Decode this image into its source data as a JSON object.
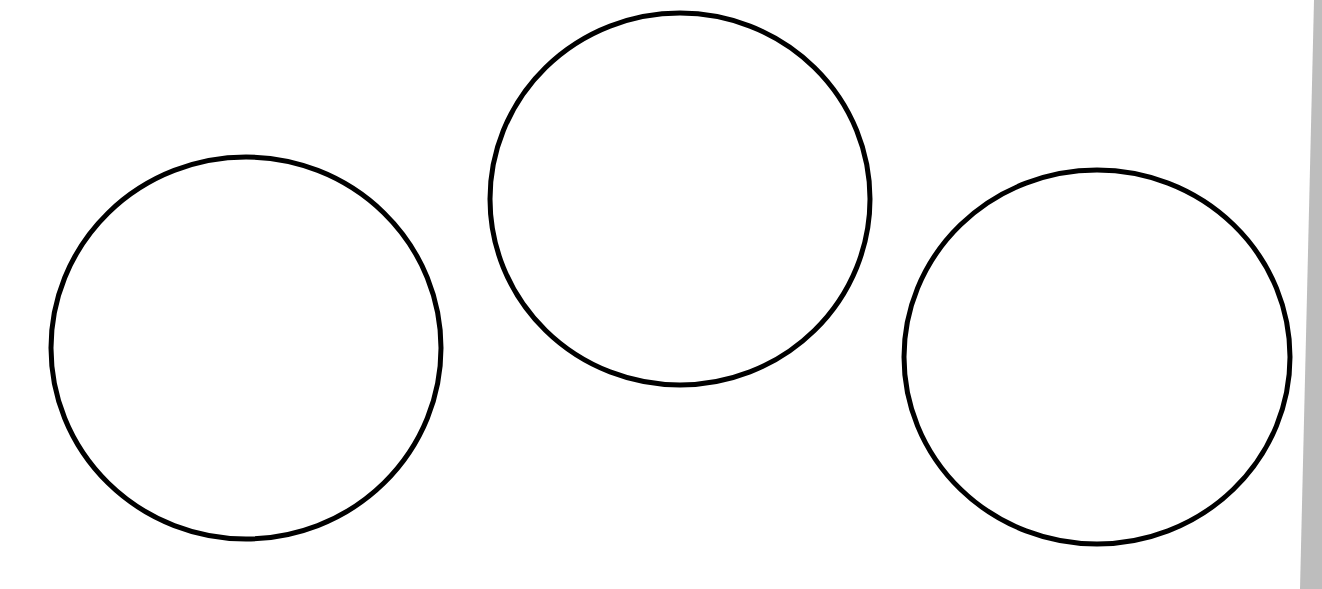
{
  "canvas": {
    "width": 1322,
    "height": 589,
    "background": "#ffffff",
    "stroke_color": "#000000"
  },
  "shapes": [
    {
      "kind": "circle-outline",
      "cx": 246,
      "cy": 348,
      "rx": 195,
      "ry": 191,
      "stroke_width": 5
    },
    {
      "kind": "circle-outline",
      "cx": 680,
      "cy": 199,
      "rx": 190,
      "ry": 186,
      "stroke_width": 5
    },
    {
      "kind": "circle-outline",
      "cx": 1097,
      "cy": 357,
      "rx": 193,
      "ry": 187,
      "stroke_width": 5
    }
  ],
  "page_edge": {
    "color": "#bdbdbd"
  }
}
